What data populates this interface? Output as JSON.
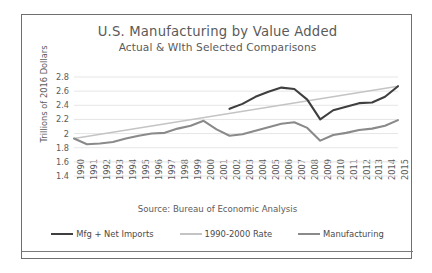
{
  "figure": {
    "title": "U.S. Manufacturing by Value Added",
    "subtitle": "Actual & WIth Selected Comparisons",
    "source_note": "Source: Bureau of Economic Analysis"
  },
  "colors": {
    "dark_series": "#3f3f3f",
    "trend_series": "#c4c4c4",
    "mid_series": "#8a8a8a",
    "gridline": "#e6e6e6",
    "text": "#5c5c5c",
    "border": "#6f6f6f"
  },
  "chart_data": {
    "type": "line",
    "title": "U.S. Manufacturing by Value Added",
    "subtitle": "Actual & WIth Selected Comparisons",
    "xlabel": "",
    "ylabel": "Trillions of 2016 Dollars",
    "ylim": [
      1.4,
      2.8
    ],
    "yticks": [
      "1.4",
      "1.6",
      "1.8",
      "2",
      "2.2",
      "2.4",
      "2.6",
      "2.8"
    ],
    "grid": true,
    "legend_position": "bottom",
    "x": [
      1990,
      1991,
      1992,
      1993,
      1994,
      1995,
      1996,
      1997,
      1998,
      1999,
      2000,
      2001,
      2002,
      2003,
      2004,
      2005,
      2006,
      2007,
      2008,
      2009,
      2010,
      2011,
      2012,
      2013,
      2014,
      2015
    ],
    "xticks": [
      "1990",
      "1991",
      "1992",
      "1993",
      "1994",
      "1995",
      "1996",
      "1997",
      "1998",
      "1999",
      "2000",
      "2001",
      "2002",
      "2003",
      "2004",
      "2005",
      "2006",
      "2007",
      "2008",
      "2009",
      "2010",
      "2011",
      "2012",
      "2013",
      "2014",
      "2015"
    ],
    "series": [
      {
        "name": "Mfg + Net Imports",
        "color": "#3f3f3f",
        "x": [
          2002,
          2003,
          2004,
          2005,
          2006,
          2007,
          2008,
          2009,
          2010,
          2011,
          2012,
          2013,
          2014,
          2015
        ],
        "values": [
          2.35,
          2.42,
          2.52,
          2.59,
          2.65,
          2.63,
          2.48,
          2.2,
          2.33,
          2.38,
          2.43,
          2.44,
          2.52,
          2.67
        ]
      },
      {
        "name": "1990-2000 Rate",
        "color": "#c4c4c4",
        "x": [
          1990,
          2015
        ],
        "values": [
          1.93,
          2.67
        ]
      },
      {
        "name": "Manufacturing",
        "color": "#8a8a8a",
        "x": [
          1990,
          1991,
          1992,
          1993,
          1994,
          1995,
          1996,
          1997,
          1998,
          1999,
          2000,
          2001,
          2002,
          2003,
          2004,
          2005,
          2006,
          2007,
          2008,
          2009,
          2010,
          2011,
          2012,
          2013,
          2014,
          2015
        ],
        "values": [
          1.93,
          1.85,
          1.86,
          1.88,
          1.93,
          1.97,
          2.0,
          2.01,
          2.07,
          2.11,
          2.18,
          2.06,
          1.97,
          1.99,
          2.04,
          2.09,
          2.14,
          2.16,
          2.08,
          1.9,
          1.98,
          2.01,
          2.05,
          2.07,
          2.11,
          2.19
        ]
      }
    ],
    "legend": [
      {
        "label": "Mfg + Net Imports",
        "color": "#3f3f3f"
      },
      {
        "label": "1990-2000 Rate",
        "color": "#c4c4c4"
      },
      {
        "label": "Manufacturing",
        "color": "#8a8a8a"
      }
    ]
  }
}
